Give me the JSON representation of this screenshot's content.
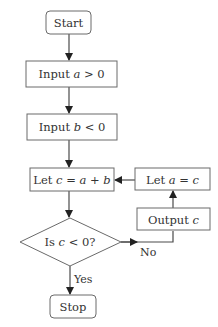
{
  "diagram": {
    "type": "flowchart",
    "nodes": {
      "start": {
        "kind": "terminal",
        "text": "Start"
      },
      "input_a": {
        "kind": "process",
        "prefix": "Input ",
        "var": "a",
        "suffix": " > 0"
      },
      "input_b": {
        "kind": "process",
        "prefix": "Input ",
        "var": "b",
        "suffix": " < 0"
      },
      "let_c": {
        "kind": "process",
        "prefix": "Let ",
        "var1": "c",
        "mid1": " = ",
        "var2": "a",
        "mid2": " + ",
        "var3": "b"
      },
      "decision": {
        "kind": "decision",
        "prefix": "Is ",
        "var": "c",
        "suffix": " < 0?"
      },
      "stop": {
        "kind": "terminal",
        "text": "Stop"
      },
      "output_c": {
        "kind": "process",
        "prefix": "Output ",
        "var": "c"
      },
      "let_a": {
        "kind": "process",
        "prefix": "Let ",
        "var1": "a",
        "mid1": " = ",
        "var2": "c"
      }
    },
    "edges": [
      {
        "from": "start",
        "to": "input_a",
        "label": ""
      },
      {
        "from": "input_a",
        "to": "input_b",
        "label": ""
      },
      {
        "from": "input_b",
        "to": "let_c",
        "label": ""
      },
      {
        "from": "let_c",
        "to": "decision",
        "label": ""
      },
      {
        "from": "decision",
        "to": "stop",
        "label": "Yes"
      },
      {
        "from": "decision",
        "to": "output_c",
        "label": "No"
      },
      {
        "from": "output_c",
        "to": "let_a",
        "label": ""
      },
      {
        "from": "let_a",
        "to": "let_c",
        "label": ""
      }
    ],
    "edge_labels": {
      "yes": "Yes",
      "no": "No"
    },
    "colors": {
      "stroke": "#6a6a6a",
      "line": "#4a4a4a",
      "text": "#333333",
      "background": "#ffffff"
    }
  }
}
